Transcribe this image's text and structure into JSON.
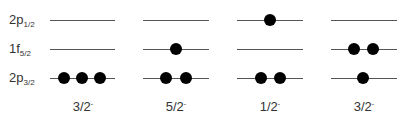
{
  "orbitals": [
    {
      "main": "2p",
      "sub": "1/2",
      "y": 20
    },
    {
      "main": "1f",
      "sub": "5/2",
      "y": 49
    },
    {
      "main": "2p",
      "sub": "3/2",
      "y": 78
    }
  ],
  "configurations": [
    {
      "label": "3/2",
      "parity": "-",
      "x0": 50,
      "x1": 115,
      "occupancy": {
        "2p1/2": [],
        "1f5/2": [],
        "2p3/2": [
          64,
          82,
          100
        ]
      }
    },
    {
      "label": "5/2",
      "parity": "-",
      "x0": 143,
      "x1": 209,
      "occupancy": {
        "2p1/2": [],
        "1f5/2": [
          176
        ],
        "2p3/2": [
          166,
          186
        ]
      }
    },
    {
      "label": "1/2",
      "parity": "-",
      "x0": 237,
      "x1": 303,
      "occupancy": {
        "2p1/2": [
          270
        ],
        "1f5/2": [],
        "2p3/2": [
          261,
          280
        ]
      }
    },
    {
      "label": "3/2",
      "parity": "-",
      "x0": 331,
      "x1": 397,
      "occupancy": {
        "2p1/2": [],
        "1f5/2": [
          354,
          373
        ],
        "2p3/2": [
          363
        ]
      }
    }
  ]
}
